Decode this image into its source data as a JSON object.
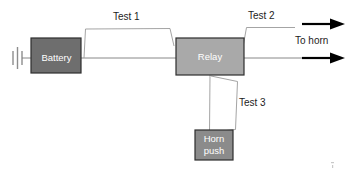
{
  "diagram": {
    "canvas": {
      "width": 352,
      "height": 188,
      "background": "#ffffff"
    },
    "nodes": [
      {
        "id": "battery",
        "label": "Battery",
        "icon": "battery-box",
        "fill": "#6e6e6e",
        "border": "#2e2e2e",
        "text_color": "#ffffff",
        "x": 31,
        "y": 38,
        "width": 50,
        "height": 35
      },
      {
        "id": "relay",
        "label": "Relay",
        "icon": "relay-box",
        "fill": "#a9a9a9",
        "border": "#2e2e2e",
        "text_color": "#ffffff",
        "x": 176,
        "y": 38,
        "width": 68,
        "height": 37
      },
      {
        "id": "horn-push",
        "label_line1": "Horn",
        "label_line2": "push",
        "icon": "horn-push-switch-box",
        "fill": "#8b8b8b",
        "border": "#2e2e2e",
        "text_color": "#ffffff",
        "x": 195,
        "y": 130,
        "width": 38,
        "height": 30
      }
    ],
    "test_points": [
      {
        "id": "test-1",
        "label": "Test 1",
        "label_x": 113,
        "label_y": 17
      },
      {
        "id": "test-2",
        "label": "Test 2",
        "label_x": 248,
        "label_y": 16
      },
      {
        "id": "test-3",
        "label": "Test 3",
        "label_x": 239,
        "label_y": 103
      }
    ],
    "annotations": [
      {
        "id": "to-horn",
        "label": "To horn",
        "label_x": 295,
        "label_y": 41
      }
    ],
    "ground": {
      "id": "chassis-ground",
      "icon": "ground-symbol",
      "color": "#8d8d8d"
    },
    "arrows": [
      {
        "id": "horn-output-arrow-upper",
        "icon": "arrow-right-icon",
        "y": 24,
        "x_start": 302,
        "x_end": 344
      },
      {
        "id": "horn-output-arrow-lower",
        "icon": "arrow-right-icon",
        "y": 58,
        "x_start": 302,
        "x_end": 344
      }
    ],
    "colors": {
      "wire": "#7c7c7c",
      "bracket": "#9a9a9a",
      "arrow": "#000000",
      "text": "#1d1d1d"
    }
  }
}
